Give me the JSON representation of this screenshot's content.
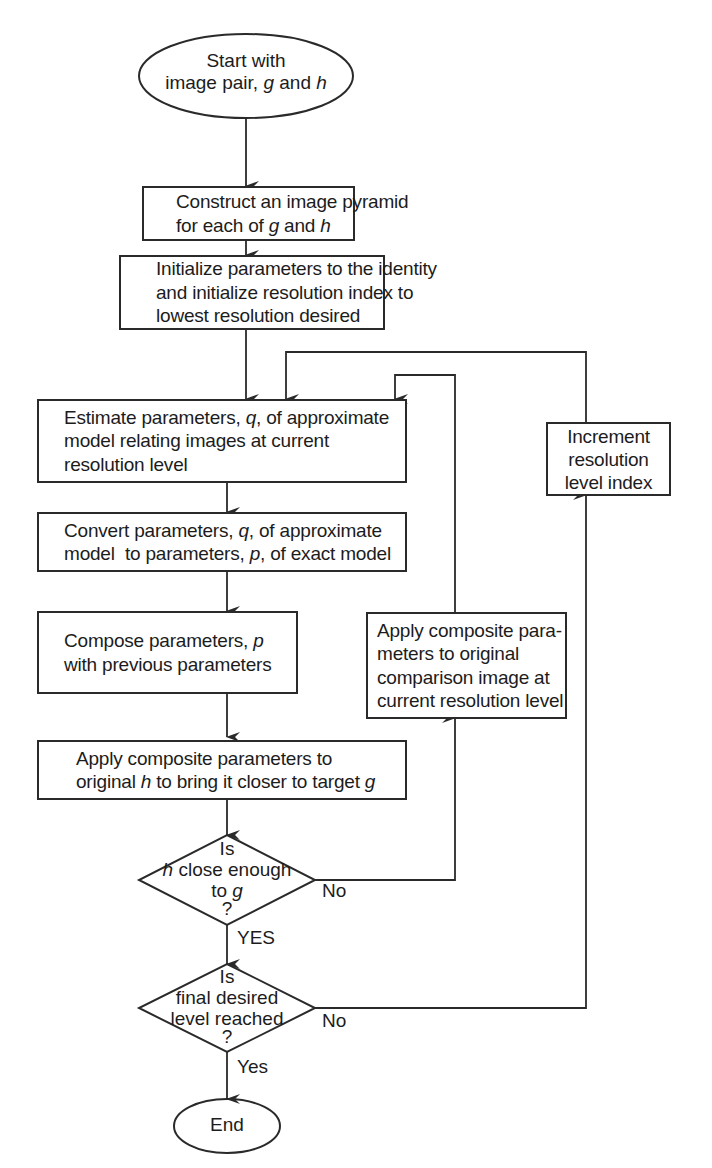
{
  "diagram": {
    "type": "flowchart",
    "colors": {
      "stroke": "#2a2a2a",
      "text": "#1c1c1c",
      "background": "#ffffff"
    },
    "nodes": {
      "start": {
        "shape": "ellipse",
        "lines": [
          "Start with",
          "image pair, g and h"
        ]
      },
      "pyramid": {
        "shape": "rect",
        "lines": [
          "Construct an image pyramid",
          "for each of g and h"
        ]
      },
      "init": {
        "shape": "rect",
        "lines": [
          "Initialize parameters to the identity",
          "and initialize resolution index to",
          "lowest resolution desired"
        ]
      },
      "estimate": {
        "shape": "rect",
        "lines": [
          "Estimate parameters, q, of approximate",
          "model relating images at current",
          "resolution level"
        ]
      },
      "convert": {
        "shape": "rect",
        "lines": [
          "Convert parameters, q, of approximate",
          "model  to parameters, p, of exact model"
        ]
      },
      "compose": {
        "shape": "rect",
        "lines": [
          "Compose parameters, p",
          "with previous parameters"
        ]
      },
      "apply_h": {
        "shape": "rect",
        "lines": [
          "Apply composite parameters to",
          "original h to bring it closer to target g"
        ]
      },
      "apply_cmp": {
        "shape": "rect",
        "lines": [
          "Apply composite para-",
          "meters to original",
          "comparison image at",
          "current resolution level"
        ]
      },
      "increment": {
        "shape": "rect",
        "lines": [
          "Increment",
          "resolution",
          "level index"
        ]
      },
      "close_enough": {
        "shape": "diamond",
        "lines": [
          "Is",
          "h close enough",
          "to g",
          "?"
        ]
      },
      "final_level": {
        "shape": "diamond",
        "lines": [
          "Is",
          "final desired",
          "level reached",
          "?"
        ]
      },
      "end": {
        "shape": "ellipse",
        "lines": [
          "End"
        ]
      }
    },
    "edge_labels": {
      "close_no": "No",
      "close_yes": "YES",
      "final_no": "No",
      "final_yes": "Yes"
    },
    "edges": [
      [
        "start",
        "pyramid"
      ],
      [
        "pyramid",
        "init"
      ],
      [
        "init",
        "estimate"
      ],
      [
        "estimate",
        "convert"
      ],
      [
        "convert",
        "compose"
      ],
      [
        "compose",
        "apply_h"
      ],
      [
        "apply_h",
        "close_enough"
      ],
      [
        "close_enough",
        "final_level",
        "YES"
      ],
      [
        "close_enough",
        "apply_cmp",
        "No"
      ],
      [
        "apply_cmp",
        "estimate"
      ],
      [
        "final_level",
        "increment",
        "No"
      ],
      [
        "increment",
        "estimate"
      ],
      [
        "final_level",
        "end",
        "Yes"
      ]
    ]
  }
}
